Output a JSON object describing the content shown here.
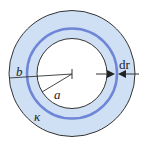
{
  "diagram": {
    "type": "coaxial-cross-section",
    "labels": {
      "outer_radius": "b",
      "inner_radius": "a",
      "conductivity": "κ",
      "shell_thickness": "dr"
    },
    "colors": {
      "fill": "#cfe0f5",
      "ring": "#6f86d6",
      "stroke": "#333333",
      "background": "#ffffff"
    }
  }
}
